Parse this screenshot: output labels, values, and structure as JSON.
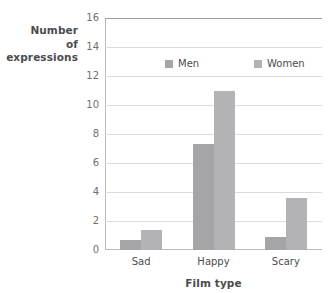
{
  "chart_data": {
    "type": "bar",
    "title": "",
    "subtitle": "",
    "xlabel": "Film type",
    "ylabel": "Number of expressions",
    "ylabel_lines": [
      "Number",
      "of",
      "expressions"
    ],
    "categories": [
      "Sad",
      "Happy",
      "Scary"
    ],
    "series": [
      {
        "name": "Men",
        "values": [
          0.7,
          7.3,
          0.9
        ],
        "color": "#a5a5a7"
      },
      {
        "name": "Women",
        "values": [
          1.35,
          11.0,
          3.6
        ],
        "color": "#b3b3b5"
      }
    ],
    "ylim": [
      0,
      16
    ],
    "ytick_labels": [
      "0",
      "2",
      "4",
      "6",
      "8",
      "10",
      "12",
      "14",
      "16"
    ],
    "ytick_values": [
      0,
      2,
      4,
      6,
      8,
      10,
      12,
      14,
      16
    ],
    "grid": true,
    "grid_axis": "y",
    "legend_position": "inside-top",
    "legend_entries": [
      "Men",
      "Women"
    ],
    "background_color": "#ffffff",
    "grid_color": "#dcdcdd",
    "axis_color": "#b9b9bb",
    "text_color": "#4c4c4e"
  }
}
